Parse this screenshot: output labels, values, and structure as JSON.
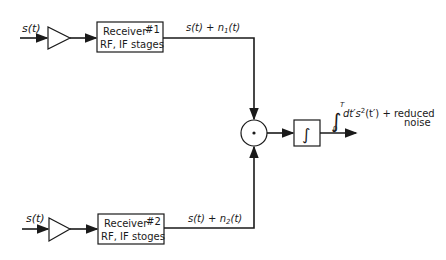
{
  "diagram": {
    "channel1": {
      "input_label": "s(t)",
      "receiver_line1": "Receiver",
      "receiver_number": "#1",
      "receiver_line2": "RF, IF stages",
      "output_label_a": "s(t) + n",
      "output_label_sub": "1",
      "output_label_b": "(t)"
    },
    "channel2": {
      "input_label": "s(t)",
      "receiver_line1": "Receiver",
      "receiver_number": "#2",
      "receiver_line2": "RF, IF stoges",
      "output_label_a": "s(t) + n",
      "output_label_sub": "2",
      "output_label_b": "(t)"
    },
    "multiplier": {
      "symbol": "·"
    },
    "integrator": {
      "symbol": "∫"
    },
    "output": {
      "integral_upper": "T",
      "integral_lower": "0",
      "integral_sign": "∫",
      "expr_a": "dt′s",
      "expr_sup": "2",
      "expr_b": "(t′) + reduced",
      "line2": "noise"
    },
    "colors": {
      "stroke": "#1a1a1a",
      "background": "#ffffff"
    }
  }
}
